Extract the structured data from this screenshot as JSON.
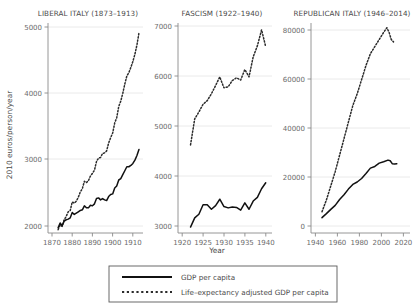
{
  "figure": {
    "ylabel": "2010 euros/person/year",
    "xlabel": "Year",
    "background": "#ffffff",
    "series_colors": {
      "solid": "#111111",
      "dotted": "#2b2b2b"
    }
  },
  "legend": {
    "items": [
      {
        "key": "solid-line-swatch",
        "label": "GDP per capita"
      },
      {
        "key": "dotted-line-swatch",
        "label": "Life–expectancy adjusted GDP per capita"
      }
    ]
  },
  "panels": [
    {
      "id": "liberal-italy",
      "title": "LIBERAL ITALY (1873–1913)",
      "xticks": [
        "1870",
        "1880",
        "1890",
        "1900",
        "1910"
      ],
      "yticks": [
        "2000",
        "3000",
        "4000",
        "5000"
      ]
    },
    {
      "id": "fascism",
      "title": "FASCISM (1922–1940)",
      "xticks": [
        "1920",
        "1925",
        "1930",
        "1935",
        "1940"
      ],
      "yticks": [
        "3000",
        "4000",
        "5000",
        "6000",
        "7000"
      ]
    },
    {
      "id": "republican-italy",
      "title": "REPUBLICAN ITALY (1946–2014)",
      "xticks": [
        "1940",
        "1960",
        "1980",
        "2000",
        "2020"
      ],
      "yticks": [
        "0",
        "20000",
        "40000",
        "60000",
        "80000"
      ]
    }
  ],
  "chart_data": {
    "type": "line",
    "title": "",
    "xlabel": "Year",
    "ylabel": "2010 euros/person/year",
    "grid": "horizontal",
    "legend_position": "bottom",
    "panels": [
      {
        "name": "LIBERAL ITALY (1873–1913)",
        "xlim": [
          1868,
          1915
        ],
        "ylim": [
          1880,
          5050
        ],
        "xticks": [
          1870,
          1880,
          1890,
          1900,
          1910
        ],
        "yticks": [
          2000,
          3000,
          4000,
          5000
        ],
        "series": [
          {
            "name": "GDP per capita",
            "style": "solid",
            "x": [
              1873,
              1874,
              1875,
              1876,
              1877,
              1878,
              1879,
              1880,
              1881,
              1882,
              1883,
              1884,
              1885,
              1886,
              1887,
              1888,
              1889,
              1890,
              1891,
              1892,
              1893,
              1894,
              1895,
              1896,
              1897,
              1898,
              1899,
              1900,
              1901,
              1902,
              1903,
              1904,
              1905,
              1906,
              1907,
              1908,
              1909,
              1910,
              1911,
              1912,
              1913
            ],
            "values": [
              1960,
              2030,
              1990,
              2060,
              2080,
              2090,
              2110,
              2190,
              2160,
              2180,
              2200,
              2220,
              2230,
              2290,
              2260,
              2260,
              2300,
              2290,
              2320,
              2400,
              2410,
              2380,
              2400,
              2380,
              2370,
              2430,
              2460,
              2470,
              2560,
              2590,
              2680,
              2700,
              2760,
              2820,
              2880,
              2880,
              2900,
              2930,
              2980,
              3050,
              3140
            ]
          },
          {
            "name": "Life–expectancy adjusted GDP per capita",
            "style": "dotted",
            "x": [
              1873,
              1874,
              1875,
              1876,
              1877,
              1878,
              1879,
              1880,
              1881,
              1882,
              1883,
              1884,
              1885,
              1886,
              1887,
              1888,
              1889,
              1890,
              1891,
              1892,
              1893,
              1894,
              1895,
              1896,
              1897,
              1898,
              1899,
              1900,
              1901,
              1902,
              1903,
              1904,
              1905,
              1906,
              1907,
              1908,
              1909,
              1910,
              1911,
              1912,
              1913
            ],
            "values": [
              1930,
              2000,
              1980,
              2080,
              2130,
              2200,
              2220,
              2350,
              2330,
              2360,
              2420,
              2500,
              2550,
              2660,
              2640,
              2670,
              2740,
              2780,
              2830,
              2960,
              3010,
              3020,
              3080,
              3090,
              3120,
              3240,
              3320,
              3390,
              3540,
              3620,
              3790,
              3870,
              3990,
              4130,
              4250,
              4300,
              4380,
              4470,
              4580,
              4720,
              4900
            ]
          }
        ]
      },
      {
        "name": "FASCISM (1922–1940)",
        "xlim": [
          1919,
          1941.5
        ],
        "ylim": [
          2900,
          7500
        ],
        "xticks": [
          1920,
          1925,
          1930,
          1935,
          1940
        ],
        "yticks": [
          3000,
          4000,
          5000,
          6000,
          7000
        ],
        "series": [
          {
            "name": "GDP per capita",
            "style": "solid",
            "x": [
              1922,
              1923,
              1924,
              1925,
              1926,
              1927,
              1928,
              1929,
              1930,
              1931,
              1932,
              1933,
              1934,
              1935,
              1936,
              1937,
              1938,
              1939,
              1940
            ],
            "values": [
              3030,
              3230,
              3310,
              3520,
              3520,
              3420,
              3500,
              3640,
              3480,
              3450,
              3470,
              3460,
              3400,
              3560,
              3420,
              3600,
              3680,
              3870,
              4000
            ]
          },
          {
            "name": "Life–expectancy adjusted GDP per capita",
            "style": "dotted",
            "x": [
              1922,
              1923,
              1924,
              1925,
              1926,
              1927,
              1928,
              1929,
              1930,
              1931,
              1932,
              1933,
              1934,
              1935,
              1936,
              1937,
              1938,
              1939,
              1940
            ],
            "values": [
              4830,
              5400,
              5550,
              5720,
              5800,
              5950,
              6130,
              6320,
              6080,
              6100,
              6240,
              6300,
              6250,
              6480,
              6320,
              6760,
              7000,
              7350,
              6980
            ]
          }
        ]
      },
      {
        "name": "REPUBLICAN ITALY (1946–2014)",
        "xlim": [
          1936,
          2026
        ],
        "ylim": [
          -3000,
          86000
        ],
        "xticks": [
          1940,
          1960,
          1980,
          2000,
          2020
        ],
        "yticks": [
          0,
          20000,
          40000,
          60000,
          80000
        ],
        "series": [
          {
            "name": "GDP per capita",
            "style": "solid",
            "x": [
              1946,
              1950,
              1954,
              1958,
              1962,
              1966,
              1970,
              1974,
              1978,
              1982,
              1986,
              1990,
              1994,
              1998,
              2002,
              2006,
              2008,
              2010,
              2012,
              2014
            ],
            "values": [
              3500,
              5200,
              7000,
              8700,
              11200,
              13200,
              15600,
              17600,
              18600,
              20100,
              22200,
              24500,
              25200,
              26600,
              27200,
              27900,
              27600,
              26300,
              26200,
              26300
            ]
          },
          {
            "name": "Life–expectancy adjusted GDP per capita",
            "style": "dotted",
            "x": [
              1946,
              1950,
              1954,
              1958,
              1962,
              1966,
              1970,
              1974,
              1978,
              1982,
              1986,
              1990,
              1994,
              1998,
              2002,
              2005,
              2007,
              2009,
              2011
            ],
            "values": [
              6000,
              11000,
              17000,
              23000,
              30000,
              37000,
              44000,
              51000,
              56000,
              62000,
              68000,
              73000,
              76000,
              79000,
              82000,
              84000,
              82000,
              79000,
              78000
            ]
          }
        ]
      }
    ]
  }
}
